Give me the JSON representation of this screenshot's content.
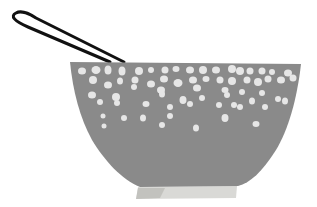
{
  "image": {
    "subject": "colander",
    "description": "Illustration of a gray colander with white perforations, a black wire loop handle, and a light pale base",
    "colors": {
      "background": "#ffffff",
      "bowl": "#8a8a8a",
      "holes": "#e6e6e6",
      "handle": "#111111",
      "base": "#d9d9d6",
      "base_shadow": "#b8b8b4"
    }
  }
}
